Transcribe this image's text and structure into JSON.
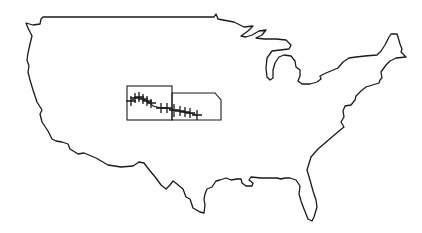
{
  "map": {
    "title": "Continental United States outline",
    "colors": {
      "background": "#ffffff",
      "line": "#1a1a1a"
    },
    "highlighted_regions": [
      {
        "name": "Colorado",
        "shape": "rectangle"
      },
      {
        "name": "Kansas",
        "shape": "rectangle-with-notched-corner"
      }
    ],
    "track": {
      "marker_icon": "star-cross-icon",
      "marker_count": 13,
      "direction": "west-to-east, descending"
    }
  }
}
